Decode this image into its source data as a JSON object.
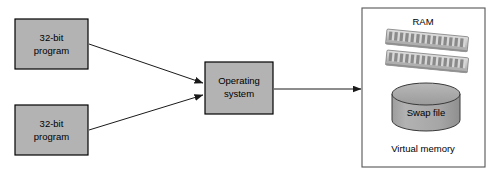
{
  "diagram": {
    "colors": {
      "box_fill": "#b3b3b3",
      "box_stroke": "#000000",
      "ram_fill": "#c8c8c8",
      "ram_chip": "#8c8c8c",
      "cylinder_fill": "#a8a8a8",
      "cylinder_top": "#9a9a9a",
      "arrow": "#1a1a1a",
      "panel_stroke": "#555555",
      "background": "#ffffff"
    },
    "programs": [
      {
        "line1": "32-bit",
        "line2": "program"
      },
      {
        "line1": "32-bit",
        "line2": "program"
      }
    ],
    "os_box": {
      "line1": "Operating",
      "line2": "system"
    },
    "virtual_memory_panel": {
      "ram_label": "RAM",
      "swap_label": "Swap file",
      "caption": "Virtual memory",
      "ram_stick_count": 2,
      "ram_chips_per_stick": 14
    },
    "arrows": [
      {
        "from": "program-1",
        "to": "operating-system"
      },
      {
        "from": "program-2",
        "to": "operating-system"
      },
      {
        "from": "operating-system",
        "to": "virtual-memory"
      }
    ]
  }
}
